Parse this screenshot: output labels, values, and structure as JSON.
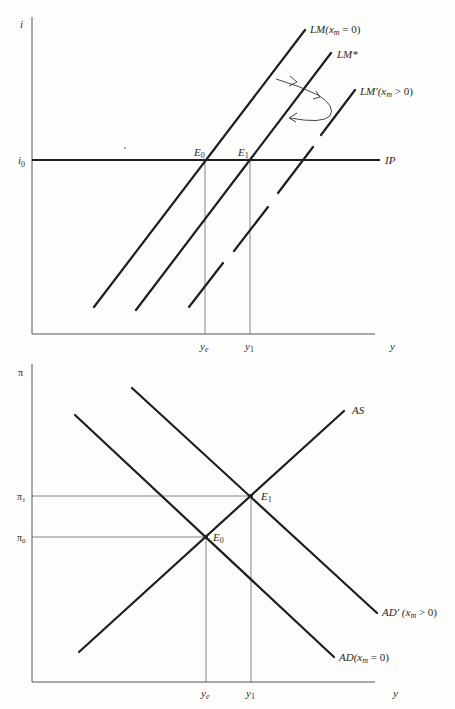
{
  "top_panel": {
    "y_axis_label": "i",
    "x_axis_label": "y",
    "i0_label": "i",
    "i0_sub": "0",
    "ye_label": "y",
    "ye_sub": "e",
    "y1_label": "y",
    "y1_sub": "1",
    "E0_label": "E",
    "E0_sub": "0",
    "E1_label": "E",
    "E1_sub": "1",
    "LM_label": "LM(x",
    "LM_sub": "m",
    "LM_tail": " = 0)",
    "LMstar_label": "LM*",
    "LMprime_label": "LM′(x",
    "LMprime_sub": "m",
    "LMprime_tail": " > 0)",
    "IP_label": "IP"
  },
  "bottom_panel": {
    "y_axis_label": "π",
    "x_axis_label": "y",
    "pi1_label": "π",
    "pi1_sub": "1",
    "pi0_label": "π",
    "pi0_sub": "0",
    "ye_label": "y",
    "ye_sub": "e",
    "y1_label": "y",
    "y1_sub": "1",
    "E0_label": "E",
    "E0_sub": "0",
    "E1_label": "E",
    "E1_sub": "1",
    "AS_label": "AS",
    "ADprime_label": "AD′ (x",
    "ADprime_sub": "m",
    "ADprime_tail": " > 0)",
    "AD_label": "AD(x",
    "AD_sub": "m",
    "AD_tail": " = 0)"
  }
}
